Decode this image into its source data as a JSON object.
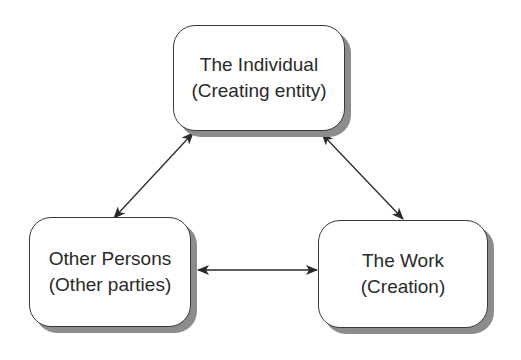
{
  "diagram": {
    "type": "triangle-relationship",
    "nodes": [
      {
        "id": "individual",
        "title": "The Individual",
        "subtitle": "(Creating entity)"
      },
      {
        "id": "other-persons",
        "title": "Other Persons",
        "subtitle": "(Other parties)"
      },
      {
        "id": "work",
        "title": "The Work",
        "subtitle": "(Creation)"
      }
    ],
    "edges": [
      {
        "from": "individual",
        "to": "other-persons",
        "direction": "bidirectional"
      },
      {
        "from": "individual",
        "to": "work",
        "direction": "bidirectional"
      },
      {
        "from": "other-persons",
        "to": "work",
        "direction": "bidirectional"
      }
    ],
    "colors": {
      "box_border": "#3a3a3a",
      "box_fill": "#ffffff",
      "shadow": "#8c8c8c",
      "text": "#2a2a2a",
      "arrow": "#2a2a2a"
    }
  }
}
